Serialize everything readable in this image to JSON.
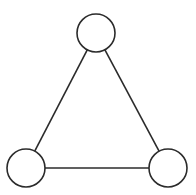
{
  "diagram": {
    "type": "graph",
    "colors": {
      "stroke": "#2b2b2b",
      "node_fill": "#ffffff",
      "background": "#ffffff"
    },
    "nodes": [
      {
        "id": "top",
        "label": "",
        "cx": 96,
        "cy": 33,
        "r": 19
      },
      {
        "id": "bottom-left",
        "label": "",
        "cx": 26,
        "cy": 168,
        "r": 19
      },
      {
        "id": "bottom-right",
        "label": "",
        "cx": 168,
        "cy": 168,
        "r": 19
      }
    ],
    "edges": [
      {
        "from": "top",
        "to": "bottom-left"
      },
      {
        "from": "top",
        "to": "bottom-right"
      },
      {
        "from": "bottom-left",
        "to": "bottom-right"
      }
    ]
  }
}
